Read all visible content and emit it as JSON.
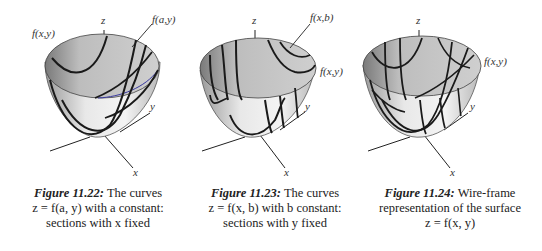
{
  "figures": [
    {
      "id": "11.22",
      "labels": {
        "z_axis": "z",
        "y_axis": "y",
        "x_axis": "x",
        "surface": "f(x,y)",
        "curve": "f(a,y)"
      },
      "caption": {
        "figure_label": "Figure 11.22:",
        "line1_rest": "The curves",
        "line2": "z = f(a, y) with a constant:",
        "line3": "sections with x fixed"
      }
    },
    {
      "id": "11.23",
      "labels": {
        "z_axis": "z",
        "y_axis": "y",
        "x_axis": "x",
        "surface": "f(x,y)",
        "curve": "f(x,b)"
      },
      "caption": {
        "figure_label": "Figure 11.23:",
        "line1_rest": "The curves",
        "line2": "z = f(x, b) with b constant:",
        "line3": "sections with y fixed"
      }
    },
    {
      "id": "11.24",
      "labels": {
        "z_axis": "z",
        "y_axis": "y",
        "x_axis": "x",
        "surface": "f(x,y)"
      },
      "caption": {
        "figure_label": "Figure 11.24:",
        "line1_rest": "Wire-frame",
        "line2": "representation of the surface",
        "line3": "z = f(x, y)"
      }
    }
  ],
  "colors": {
    "surface_fill": "#d4d4d4",
    "curve_stroke": "#1a1a1a",
    "rim_accent": "#3a3aa0"
  }
}
